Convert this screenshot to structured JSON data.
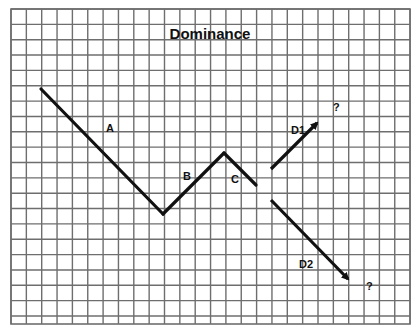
{
  "title": "Dominance",
  "colors": {
    "background": "#ffffff",
    "grid": "#6e6e6e",
    "line": "#111111"
  },
  "grid": {
    "left": 11,
    "top": 9,
    "right": 410,
    "bottom": 324,
    "spacing": 15.35
  },
  "segments": [
    {
      "label": "A",
      "from": [
        41,
        89
      ],
      "to": [
        163,
        214
      ],
      "label_pos": [
        106,
        132
      ]
    },
    {
      "label": "B",
      "from": [
        163,
        214
      ],
      "to": [
        224,
        153
      ],
      "label_pos": [
        183,
        180
      ]
    },
    {
      "label": "C",
      "from": [
        224,
        153
      ],
      "to": [
        256,
        185
      ],
      "label_pos": [
        231,
        183
      ]
    }
  ],
  "arrows": [
    {
      "label": "D1",
      "from": [
        271,
        169
      ],
      "to": [
        317,
        123
      ],
      "label_pos": [
        291,
        134
      ],
      "end_label": "?",
      "end_label_pos": [
        333,
        111
      ]
    },
    {
      "label": "D2",
      "from": [
        271,
        200
      ],
      "to": [
        348,
        279
      ],
      "label_pos": [
        299,
        268
      ],
      "end_label": "?",
      "end_label_pos": [
        366,
        290
      ]
    }
  ]
}
